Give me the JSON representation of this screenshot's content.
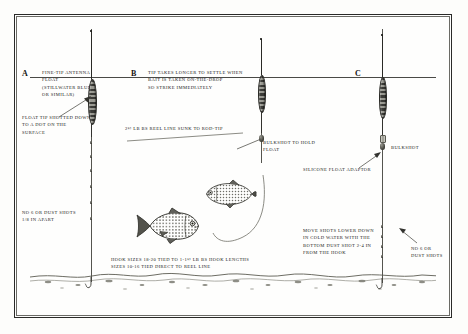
{
  "diagram": {
    "sections": {
      "a": {
        "letter": "A",
        "caption": "FINE-TIP ANTENNA\nFLOAT\n(STILLWATER BLUE\nOR SIMILAR)",
        "note_float_tip": "FLOAT TIP SHOTTED DOWN\nTO A DOT ON THE\nSURFACE",
        "note_shots": "NO 6 OR DUST SHOTS\n1/8 IN APART"
      },
      "b": {
        "letter": "B",
        "caption": "TIP TAKES LONGER TO SETTLE WHEN\nBAIT IS TAKEN ON-THE-DROP\nSO STRIKE IMMEDIATELY",
        "note_reel_line": "2½ LB BS REEL LINE SUNK TO ROD-TIP",
        "note_bulkshot": "BULKSHOT TO HOLD\nFLOAT"
      },
      "c": {
        "letter": "C",
        "note_bulkshot": "BULKSHOT",
        "note_adaptor": "SILICONE FLOAT ADAPTOR",
        "note_cold_water": "MOVE SHOTS LOWER DOWN\nIN COLD WATER WITH THE\nBOTTOM DUST SHOT 2-4 IN\nFROM THE HOOK",
        "note_shots": "NO 6 OR\nDUST SHOTS"
      }
    },
    "hook_sizes": "HOOK SIZES 18-20 TIED TO 1-1½ LB BS HOOK LENGTHS\nSIZES 10-16 TIED DIRECT TO REEL LINE",
    "colors": {
      "ink": "#1a1a18",
      "line": "#55554f",
      "frame": "#2a2a28",
      "water": "#4a4a46"
    }
  }
}
